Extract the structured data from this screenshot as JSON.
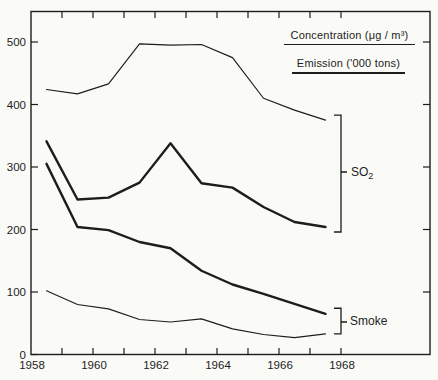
{
  "figure": {
    "paper_color": "#fafaf7",
    "ink_color": "#1d1d1d"
  },
  "legend": {
    "concentration": "Concentration (μg / m³)",
    "emission": "Emission ('000 tons)"
  },
  "annotations": {
    "so2": {
      "base": "SO",
      "sub": "2",
      "bracket_year": 1968,
      "value_top": 383,
      "value_bottom": 196,
      "pointer_value": 292
    },
    "smoke": {
      "label": "Smoke",
      "bracket_year": 1968,
      "value_top": 74,
      "value_bottom": 33,
      "pointer_value": 52
    }
  },
  "axes": {
    "y_ticks": [
      0,
      100,
      200,
      300,
      400,
      500
    ],
    "y_tick_labels": [
      "0",
      "100",
      "200",
      "300",
      "400",
      "500"
    ],
    "x_minor_ticks": [
      1959,
      1960,
      1961,
      1962,
      1963,
      1964,
      1965,
      1966,
      1967,
      1968
    ],
    "x_label_positions": [
      1958,
      1960,
      1962,
      1964,
      1966,
      1968
    ],
    "x_tick_labels": [
      "1958",
      "1960",
      "1962",
      "1964",
      "1966",
      "1968"
    ]
  },
  "chart_data": {
    "type": "line",
    "title": "",
    "xlabel": "",
    "ylabel": "",
    "xlim": [
      1958,
      1970.9
    ],
    "ylim": [
      0,
      548
    ],
    "grid": false,
    "frame": true,
    "x": [
      1958.5,
      1959.5,
      1960.5,
      1961.5,
      1962.5,
      1963.5,
      1964.5,
      1965.5,
      1966.5,
      1967.5
    ],
    "series": [
      {
        "name": "so2-concentration",
        "group": "SO2",
        "measure": "Concentration (μg / m³)",
        "style": "thin",
        "values": [
          424,
          417,
          433,
          497,
          495,
          496,
          475,
          410,
          391,
          375
        ]
      },
      {
        "name": "so2-emission",
        "group": "SO2",
        "measure": "Emission ('000 tons)",
        "style": "thick",
        "values": [
          341,
          248,
          251,
          275,
          338,
          274,
          267,
          236,
          212,
          204
        ]
      },
      {
        "name": "smoke-emission",
        "group": "Smoke",
        "measure": "Emission ('000 tons)",
        "style": "thick",
        "values": [
          305,
          204,
          199,
          180,
          170,
          134,
          112,
          97,
          81,
          65
        ]
      },
      {
        "name": "smoke-concentration",
        "group": "Smoke",
        "measure": "Concentration (μg / m³)",
        "style": "thin",
        "values": [
          102,
          80,
          73,
          56,
          52,
          57,
          41,
          32,
          27,
          33
        ]
      }
    ]
  }
}
